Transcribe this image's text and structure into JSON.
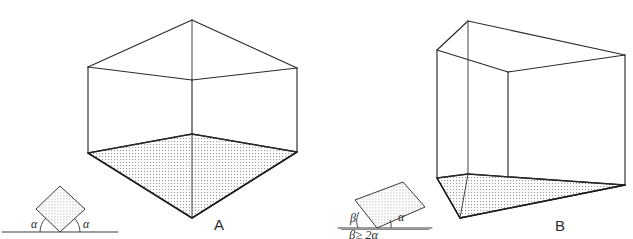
{
  "figure": {
    "background_color": "#ffffff",
    "line_color": "#2b2b2b",
    "fill_pattern": "fine-dot-stipple",
    "fill_dot_color": "#9a9a9a"
  },
  "panels": [
    {
      "id": "A",
      "label": "A",
      "label_x": 214,
      "label_y": 230,
      "description": "box viewed corner-on, vertical edge toward viewer, shaded floor forming a diamond",
      "inset": {
        "shape": "square rotated 45 degrees resting on one corner",
        "angle_labels": [
          {
            "text": "α",
            "x": 36,
            "y": 226
          },
          {
            "text": "α",
            "x": 84,
            "y": 226
          }
        ],
        "caption": "",
        "ground_line": true
      }
    },
    {
      "id": "B",
      "label": "B",
      "label_x": 555,
      "label_y": 231,
      "description": "box viewed with one face nearly frontal, shaded floor forming a wide parallelogram",
      "inset": {
        "shape": "square tilted at a shallow angle resting on one corner",
        "angle_labels": [
          {
            "text": "β",
            "x": 355,
            "y": 222
          },
          {
            "text": "α",
            "x": 401,
            "y": 221
          }
        ],
        "caption": "β≥ 2α",
        "ground_line": true
      }
    }
  ],
  "geometry": {
    "A": {
      "top_apex": [
        192,
        20
      ],
      "top_left": [
        88,
        67
      ],
      "top_right": [
        297,
        68
      ],
      "top_center": [
        192,
        80
      ],
      "bot_center": [
        192,
        134
      ],
      "bot_left": [
        88,
        153
      ],
      "bot_right": [
        297,
        152
      ],
      "bot_apex": [
        192,
        218
      ]
    },
    "B": {
      "top_back_left": [
        468,
        21
      ],
      "top_left": [
        437,
        50
      ],
      "top_right": [
        625,
        55
      ],
      "top_front_right": [
        508,
        72
      ],
      "bot_back_left": [
        468,
        174
      ],
      "bot_left": [
        437,
        178
      ],
      "bot_right": [
        625,
        185
      ],
      "bot_front": [
        460,
        218
      ]
    }
  },
  "insets": {
    "A": {
      "pivot": [
        60,
        232
      ],
      "square_top": [
        60,
        186
      ],
      "square_left": [
        36,
        209
      ],
      "square_right": [
        85,
        209
      ],
      "ground_x1": 2,
      "ground_x2": 118,
      "ground_y": 232
    },
    "B": {
      "pivot": [
        377,
        228
      ],
      "square_top": [
        403,
        182
      ],
      "square_left": [
        355,
        200
      ],
      "square_right": [
        425,
        207
      ],
      "ground_x1": 338,
      "ground_x2": 432,
      "ground_y": 228,
      "caption_x": 349,
      "caption_y": 238,
      "rule_x1": 341,
      "rule_x2": 429,
      "rule_y": 229
    }
  }
}
